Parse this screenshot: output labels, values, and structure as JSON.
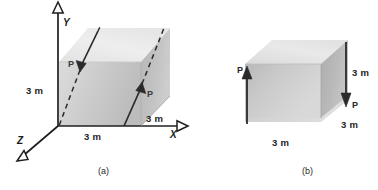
{
  "figure": {
    "title_parts": [
      "(a)",
      "(b)"
    ],
    "caption_a": "(a)",
    "caption_b": "(b)",
    "colors": {
      "line": "#1f1f1f",
      "cube_light": "#e8e8e8",
      "cube_mid": "#cfcfcf",
      "cube_dark": "#b4b4b4",
      "cube_edge": "#9a9a9a",
      "text": "#1a1a1a",
      "force_text": "#3a3a3a"
    }
  },
  "part_a": {
    "caption": "(a)",
    "axes": [
      {
        "name": "y-axis",
        "label": "Y"
      },
      {
        "name": "x-axis",
        "label": "X"
      },
      {
        "name": "z-axis",
        "label": "Z"
      }
    ],
    "axis_y_label": "Y",
    "axis_x_label": "X",
    "axis_z_label": "Z",
    "dimensions": [
      {
        "name": "height",
        "label": "3 m"
      },
      {
        "name": "width-front",
        "label": "3 m"
      },
      {
        "name": "depth",
        "label": "3 m"
      }
    ],
    "dim_height": "3 m",
    "dim_width": "3 m",
    "dim_depth": "3 m",
    "forces": [
      {
        "name": "force-p-left",
        "label": "P",
        "direction": "down-right"
      },
      {
        "name": "force-p-right",
        "label": "P",
        "direction": "up-right"
      }
    ],
    "force_left_label": "P",
    "force_right_label": "P"
  },
  "part_b": {
    "caption": "(b)",
    "dimensions": [
      {
        "name": "height-right",
        "label": "3 m"
      },
      {
        "name": "depth-right",
        "label": "3 m"
      },
      {
        "name": "width-bottom",
        "label": "3 m"
      }
    ],
    "dim_height": "3 m",
    "dim_depth": "3 m",
    "dim_width": "3 m",
    "forces": [
      {
        "name": "force-p-left-up",
        "label": "P",
        "direction": "up"
      },
      {
        "name": "force-p-right-down",
        "label": "P",
        "direction": "down"
      }
    ],
    "force_left_label": "P",
    "force_right_label": "P"
  }
}
